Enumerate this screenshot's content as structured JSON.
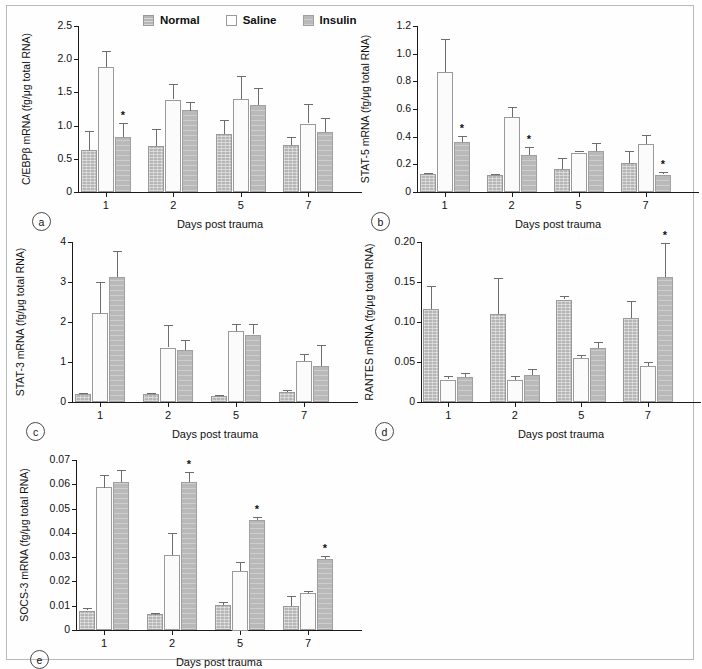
{
  "figure": {
    "legend": {
      "position": "top-center-panel-a",
      "entries": [
        {
          "key": "normal",
          "label": "Normal",
          "color": "#b6b6b6",
          "pattern": "hatched"
        },
        {
          "key": "saline",
          "label": "Saline",
          "color": "#fbfbfb",
          "pattern": "solid-white"
        },
        {
          "key": "insulin",
          "label": "Insulin",
          "color": "#b9b9b9",
          "pattern": "hatched"
        }
      ]
    },
    "shared": {
      "xlabel": "Days post trauma",
      "categories": [
        "1",
        "2",
        "5",
        "7"
      ],
      "significance_marker": "*"
    }
  },
  "chart_data": [
    {
      "id": "a",
      "tag": "a",
      "type": "bar",
      "title": "",
      "ylabel": "C/EBPβ mRNA (fg/μg total RNA)",
      "xlabel": "Days post trauma",
      "categories": [
        "1",
        "2",
        "5",
        "7"
      ],
      "ylim": [
        0,
        2.5
      ],
      "yticks": [
        0,
        0.5,
        1.0,
        1.5,
        2.0,
        2.5
      ],
      "ytick_labels": [
        "0",
        "0.5",
        "1.0",
        "1.5",
        "2.0",
        "2.5"
      ],
      "grid": false,
      "series": [
        {
          "name": "Normal",
          "values": [
            0.64,
            0.69,
            0.88,
            0.71
          ],
          "errors": [
            0.28,
            0.26,
            0.21,
            0.12
          ]
        },
        {
          "name": "Saline",
          "values": [
            1.88,
            1.39,
            1.4,
            1.03
          ],
          "errors": [
            0.24,
            0.23,
            0.35,
            0.29
          ]
        },
        {
          "name": "Insulin",
          "values": [
            0.83,
            1.23,
            1.31,
            0.9
          ],
          "errors": [
            0.21,
            0.13,
            0.26,
            0.21
          ]
        }
      ],
      "significance": [
        {
          "category": "1",
          "series": "Insulin"
        }
      ]
    },
    {
      "id": "b",
      "tag": "b",
      "type": "bar",
      "title": "",
      "ylabel": "STAT-5 mRNA (fg/μg total RNA)",
      "xlabel": "Days post trauma",
      "categories": [
        "1",
        "2",
        "5",
        "7"
      ],
      "ylim": [
        0,
        1.2
      ],
      "yticks": [
        0,
        0.2,
        0.4,
        0.6,
        0.8,
        1.0,
        1.2
      ],
      "ytick_labels": [
        "0",
        "0.2",
        "0.4",
        "0.6",
        "0.8",
        "1.0",
        "1.2"
      ],
      "grid": false,
      "series": [
        {
          "name": "Normal",
          "values": [
            0.133,
            0.126,
            0.165,
            0.211
          ],
          "errors": [
            0.004,
            0.005,
            0.08,
            0.086
          ]
        },
        {
          "name": "Saline",
          "values": [
            0.868,
            0.543,
            0.285,
            0.346
          ],
          "errors": [
            0.24,
            0.073,
            0.009,
            0.065
          ]
        },
        {
          "name": "Insulin",
          "values": [
            0.361,
            0.269,
            0.296,
            0.126
          ],
          "errors": [
            0.043,
            0.055,
            0.055,
            0.016
          ]
        }
      ],
      "significance": [
        {
          "category": "1",
          "series": "Insulin"
        },
        {
          "category": "2",
          "series": "Insulin"
        },
        {
          "category": "7",
          "series": "Insulin"
        }
      ]
    },
    {
      "id": "c",
      "tag": "c",
      "type": "bar",
      "title": "",
      "ylabel": "STAT-3 mRNA (fg/μg total RNA)",
      "xlabel": "Days post trauma",
      "categories": [
        "1",
        "2",
        "5",
        "7"
      ],
      "ylim": [
        0,
        4
      ],
      "yticks": [
        0,
        1,
        2,
        3,
        4
      ],
      "ytick_labels": [
        "0",
        "1",
        "2",
        "3",
        "4"
      ],
      "grid": false,
      "series": [
        {
          "name": "Normal",
          "values": [
            0.21,
            0.21,
            0.14,
            0.26
          ],
          "errors": [
            0.01,
            0.02,
            0.03,
            0.04
          ]
        },
        {
          "name": "Saline",
          "values": [
            2.22,
            1.36,
            1.78,
            1.02
          ],
          "errors": [
            0.78,
            0.56,
            0.18,
            0.17
          ]
        },
        {
          "name": "Insulin",
          "values": [
            3.12,
            1.3,
            1.68,
            0.91
          ],
          "errors": [
            0.66,
            0.26,
            0.26,
            0.52
          ]
        }
      ],
      "significance": []
    },
    {
      "id": "d",
      "tag": "d",
      "type": "bar",
      "title": "",
      "ylabel": "RANTES mRNA (fg/μg total RNA)",
      "xlabel": "Days post trauma",
      "categories": [
        "1",
        "2",
        "5",
        "7"
      ],
      "ylim": [
        0,
        0.2
      ],
      "yticks": [
        0,
        0.05,
        0.1,
        0.15,
        0.2
      ],
      "ytick_labels": [
        "0",
        "0.05",
        "0.10",
        "0.15",
        "0.20"
      ],
      "grid": false,
      "series": [
        {
          "name": "Normal",
          "values": [
            0.116,
            0.11,
            0.128,
            0.105
          ],
          "errors": [
            0.029,
            0.045,
            0.004,
            0.021
          ]
        },
        {
          "name": "Saline",
          "values": [
            0.028,
            0.027,
            0.055,
            0.045
          ],
          "errors": [
            0.004,
            0.005,
            0.004,
            0.005
          ]
        },
        {
          "name": "Insulin",
          "values": [
            0.031,
            0.034,
            0.068,
            0.156
          ],
          "errors": [
            0.005,
            0.007,
            0.007,
            0.043
          ]
        }
      ],
      "significance": [
        {
          "category": "7",
          "series": "Insulin"
        }
      ]
    },
    {
      "id": "e",
      "tag": "e",
      "type": "bar",
      "title": "",
      "ylabel": "SOCS-3 mRNA (fg/μg total RNA)",
      "xlabel": "Days post trauma",
      "categories": [
        "1",
        "2",
        "5",
        "7"
      ],
      "ylim": [
        0,
        0.07
      ],
      "yticks": [
        0,
        0.01,
        0.02,
        0.03,
        0.04,
        0.05,
        0.06,
        0.07
      ],
      "ytick_labels": [
        "0",
        "0.01",
        "0.02",
        "0.03",
        "0.04",
        "0.05",
        "0.06",
        "0.07"
      ],
      "grid": false,
      "series": [
        {
          "name": "Normal",
          "values": [
            0.008,
            0.0065,
            0.0102,
            0.0097
          ],
          "errors": [
            0.0009,
            0.0007,
            0.0014,
            0.0043
          ]
        },
        {
          "name": "Saline",
          "values": [
            0.0588,
            0.0308,
            0.0245,
            0.0151
          ],
          "errors": [
            0.0052,
            0.0092,
            0.0037,
            0.0008
          ]
        },
        {
          "name": "Insulin",
          "values": [
            0.061,
            0.061,
            0.0452,
            0.0293
          ],
          "errors": [
            0.005,
            0.004,
            0.0012,
            0.0013
          ]
        }
      ],
      "significance": [
        {
          "category": "2",
          "series": "Insulin"
        },
        {
          "category": "5",
          "series": "Insulin"
        },
        {
          "category": "7",
          "series": "Insulin"
        }
      ]
    }
  ]
}
